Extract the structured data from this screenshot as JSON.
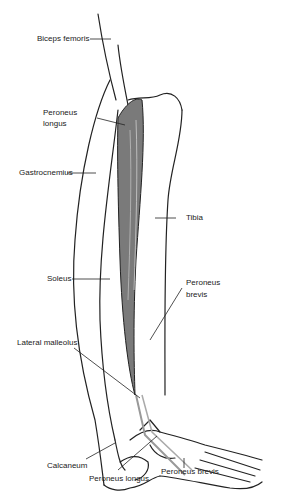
{
  "diagram": {
    "type": "anatomical-illustration",
    "labels": {
      "biceps_femoris": "Biceps femoris",
      "peroneus_longus_upper_1": "Peroneus",
      "peroneus_longus_upper_2": "longus",
      "gastrocnemius": "Gastrocnemius",
      "tibia": "Tibia",
      "soleus": "Soleus",
      "peroneus_brevis_upper_1": "Peroneus",
      "peroneus_brevis_upper_2": "brevis",
      "lateral_malleolus": "Lateral malleolus",
      "calcaneum": "Calcaneum",
      "peroneus_longus_lower": "Peroneus longus",
      "peroneus_brevis_lower": "Peroneus brevis"
    }
  }
}
